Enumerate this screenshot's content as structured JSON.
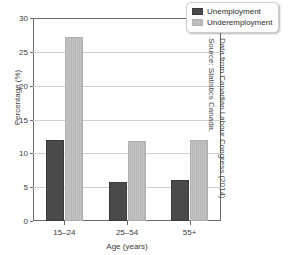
{
  "chart_data": {
    "type": "bar",
    "title": "",
    "subtitle": "",
    "xlabel": "Age (years)",
    "ylabel": "Percentage (%)",
    "categories": [
      "15–24",
      "25–54",
      "55+"
    ],
    "series": [
      {
        "name": "Unemployment",
        "color": "#4a4a4a",
        "values": [
          12.0,
          5.8,
          6.0
        ]
      },
      {
        "name": "Underemployment",
        "color": "#c0c0c0",
        "values": [
          27.2,
          11.8,
          12.0
        ]
      }
    ],
    "ylim": [
      0,
      30
    ],
    "yticks": [
      0,
      5,
      10,
      15,
      20,
      25,
      30
    ],
    "ytick_labels": [
      "0",
      "5",
      "10",
      "15",
      "20",
      "25",
      "30"
    ],
    "grid": true,
    "grid_axis": "y",
    "legend_position": "top-right",
    "annotations": [
      "Data from Canadian Labour Congress (2014)",
      "Source: Statistics Canada."
    ]
  },
  "legend": {
    "items": [
      {
        "label": "Unemployment"
      },
      {
        "label": "Underemployment"
      }
    ]
  },
  "source_note": {
    "line1": "Data from Canadian Labour Congress (2014)",
    "line2": "Source: Statistics Canada."
  }
}
